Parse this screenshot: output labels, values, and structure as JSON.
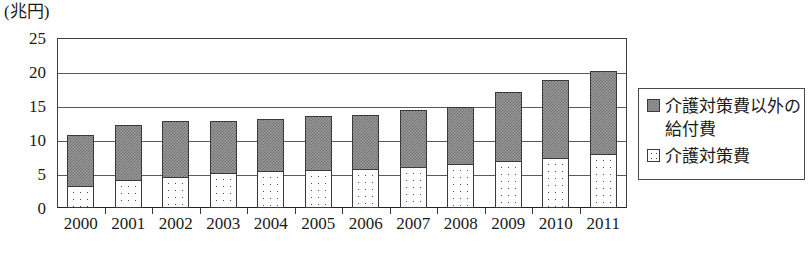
{
  "chart_data": {
    "type": "bar",
    "subtype": "stacked-vertical",
    "title": "",
    "unit_label": "(兆円)",
    "xlabel": "",
    "ylabel": "",
    "ylim": [
      0,
      25
    ],
    "yticks": [
      0,
      5,
      10,
      15,
      20,
      25
    ],
    "ytick_labels": [
      "0",
      "5",
      "10",
      "15",
      "20",
      "25"
    ],
    "grid": true,
    "grid_axis": "y",
    "legend_position": "right",
    "categories": [
      "2000",
      "2001",
      "2002",
      "2003",
      "2004",
      "2005",
      "2006",
      "2007",
      "2008",
      "2009",
      "2010",
      "2011"
    ],
    "series": [
      {
        "name": "介護対策費",
        "order": "bottom",
        "fill": "dotted",
        "values": [
          3.3,
          4.1,
          4.6,
          5.1,
          5.4,
          5.6,
          5.8,
          6.1,
          6.4,
          6.9,
          7.3,
          7.9
        ]
      },
      {
        "name": "介護対策費以外の給付費",
        "order": "top",
        "fill": "gray-checker",
        "values": [
          7.5,
          8.1,
          8.2,
          7.7,
          7.7,
          7.9,
          7.9,
          8.3,
          8.4,
          10.2,
          11.5,
          12.3
        ]
      }
    ],
    "totals": [
      10.8,
      12.2,
      12.8,
      12.8,
      13.1,
      13.5,
      13.7,
      14.4,
      14.8,
      17.1,
      18.8,
      20.2
    ],
    "colors": {
      "upper_fill": "#9a9a9a",
      "lower_fill": "#fdfdfd",
      "bar_outline": "#3a3a3a",
      "gridline": "#5a5a5a",
      "frame": "#404040",
      "text": "#1a1a1a"
    }
  },
  "legend": {
    "items": [
      {
        "label": "介護対策費以外の給付費",
        "swatch": "gray-checker-swatch"
      },
      {
        "label": "介護対策費",
        "swatch": "dotted-swatch"
      }
    ]
  }
}
